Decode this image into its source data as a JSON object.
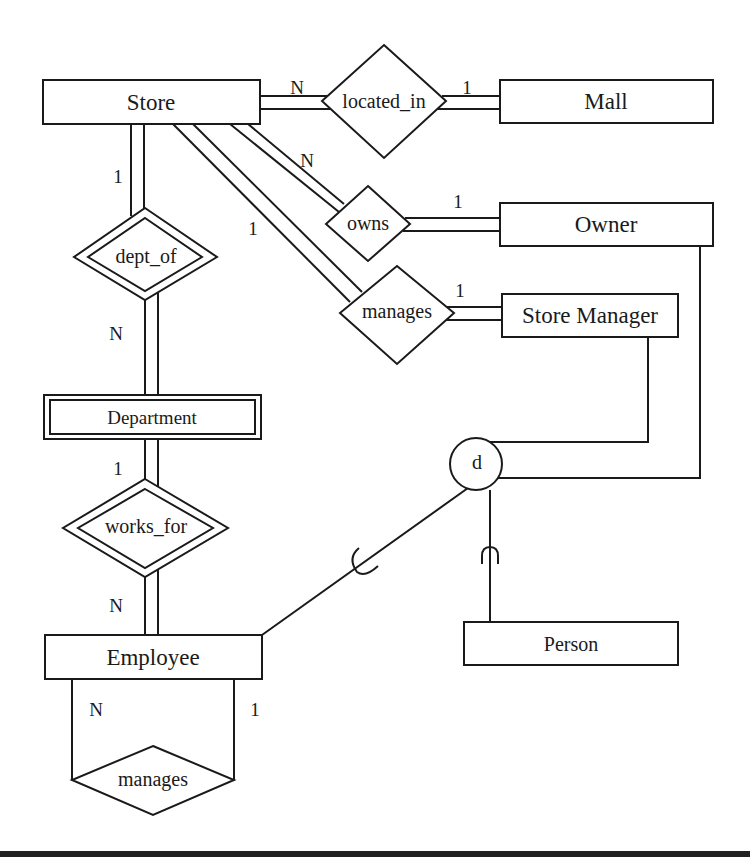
{
  "diagram": {
    "type": "EER diagram",
    "entities": [
      {
        "id": "store",
        "label": "Store"
      },
      {
        "id": "mall",
        "label": "Mall"
      },
      {
        "id": "owner",
        "label": "Owner"
      },
      {
        "id": "store_manager",
        "label": "Store Manager"
      },
      {
        "id": "department",
        "label": "Department",
        "weak": true
      },
      {
        "id": "employee",
        "label": "Employee"
      },
      {
        "id": "person",
        "label": "Person"
      }
    ],
    "relationships": [
      {
        "id": "located_in",
        "label": "located_in",
        "identifying": false
      },
      {
        "id": "owns",
        "label": "owns",
        "identifying": false
      },
      {
        "id": "manages_store",
        "label": "manages",
        "identifying": false
      },
      {
        "id": "dept_of",
        "label": "dept_of",
        "identifying": true
      },
      {
        "id": "works_for",
        "label": "works_for",
        "identifying": true
      },
      {
        "id": "manages_employee",
        "label": "manages",
        "identifying": false
      }
    ],
    "specialization": {
      "symbol": "d",
      "superclass": "Person",
      "subclasses": [
        "Owner",
        "Store Manager",
        "Employee"
      ]
    },
    "cardinalities": {
      "store_located_in": "N",
      "mall_located_in": "1",
      "store_owns": "N",
      "owner_owns": "1",
      "store_manages": "1",
      "manager_manages": "1",
      "store_dept_of": "1",
      "department_dept_of": "N",
      "department_works_for": "1",
      "employee_works_for": "N",
      "employee_manages_left": "N",
      "employee_manages_right": "1"
    }
  }
}
